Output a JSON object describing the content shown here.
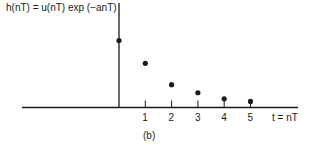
{
  "chart_data": {
    "type": "scatter",
    "title": "h(nT) = u(nT) exp (−anT)",
    "xlabel": "t = nT",
    "ylabel": "h(nT)",
    "caption": "(b)",
    "x": [
      0,
      1,
      2,
      3,
      4,
      5
    ],
    "values": [
      1.0,
      0.66,
      0.34,
      0.22,
      0.13,
      0.09
    ],
    "tick_labels": [
      "1",
      "2",
      "3",
      "4",
      "5"
    ],
    "grid": false,
    "xlim": [
      -3.6,
      5.9
    ],
    "ylim": [
      0,
      1.55
    ]
  }
}
